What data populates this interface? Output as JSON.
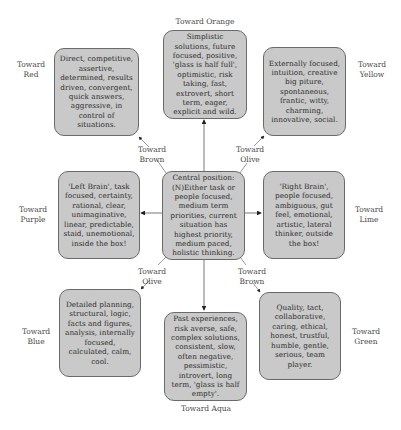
{
  "diagram": {
    "center": {
      "text": "Central position: (N)Either task or people focused, medium term priorities, current situation has highest priority, medium paced, holistic thinking."
    },
    "boxes": [
      {
        "id": "red",
        "direction_label": "Toward\nRed",
        "text": "Direct, competitive, assertive, determined, results driven, convergent, quick answers, aggressive, in control of situations."
      },
      {
        "id": "orange",
        "direction_label": "Toward Orange",
        "text": "Simplistic solutions, future focused, positive, 'glass is half full', optimistic, risk taking, fast, extrovert, short term, eager, explicit and wild."
      },
      {
        "id": "yellow",
        "direction_label": "Toward\nYellow",
        "text": "Externally focused, intuition, creative big piture, spontaneous, frantic, witty, charming, innovative, social."
      },
      {
        "id": "purple",
        "direction_label": "Toward\nPurple",
        "text": "'Left Brain', task focused, certainty, rational, clear, unimaginative, linear, predictable, staid, unemotional, inside the box!"
      },
      {
        "id": "lime",
        "direction_label": "Toward\nLime",
        "text": "'Right Brain', people focused, ambiguous, gut feel, emotional, artistic, lateral thinker, outside the box!"
      },
      {
        "id": "blue",
        "direction_label": "Toward\nBlue",
        "text": "Detailed planning, structural, logic, facts and figures, analysis, internally focused, calculated, calm, cool."
      },
      {
        "id": "aqua",
        "direction_label": "Toward Aqua",
        "text": "Past experiences, risk averse, safe, complex solutions, consistent, slow, often negative, pessimistic, introvert, long term, 'glass is half empty'."
      },
      {
        "id": "green",
        "direction_label": "Toward\nGreen",
        "text": "Quality, tact, collaborative, caring, ethical, honest, trustful, humble, gentle, serious, team player."
      }
    ],
    "diagonal_labels": {
      "upper_left": "Toward\nBrown",
      "upper_right": "Toward\nOlive",
      "lower_left": "Toward\nOlive",
      "lower_right": "Toward\nBrown"
    },
    "colors": {
      "box_fill": "#c9c9c9",
      "box_border": "#6a6a6a",
      "arrow": "#333333",
      "text": "#2e2e2e"
    }
  }
}
